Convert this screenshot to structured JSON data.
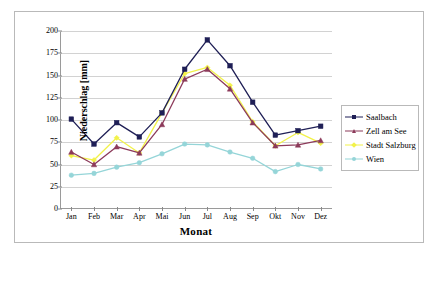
{
  "chart_data": {
    "type": "line",
    "title": "",
    "xlabel": "Monat",
    "ylabel": "Niederschlag [mm]",
    "categories": [
      "Jan",
      "Feb",
      "Mar",
      "Apr",
      "Mai",
      "Jun",
      "Jul",
      "Aug",
      "Sep",
      "Okt",
      "Nov",
      "Dez"
    ],
    "ylim": [
      0,
      200
    ],
    "yticks": [
      0,
      25,
      50,
      75,
      100,
      125,
      150,
      175,
      200
    ],
    "grid": true,
    "legend_position": "right",
    "series": [
      {
        "name": "Saalbach",
        "color": "#1f1f56",
        "marker": "square",
        "values": [
          101,
          73,
          97,
          81,
          108,
          157,
          190,
          161,
          120,
          83,
          88,
          93
        ]
      },
      {
        "name": "Zell am See",
        "color": "#8c3a5a",
        "marker": "triangle",
        "values": [
          64,
          50,
          70,
          63,
          95,
          146,
          157,
          135,
          97,
          71,
          72,
          77
        ]
      },
      {
        "name": "Stadt Salzburg",
        "color": "#f2f24a",
        "marker": "diamond",
        "values": [
          60,
          55,
          80,
          63,
          108,
          152,
          159,
          139,
          98,
          71,
          86,
          74
        ]
      },
      {
        "name": "Wien",
        "color": "#95d5d8",
        "marker": "circle",
        "values": [
          38,
          40,
          47,
          52,
          62,
          73,
          72,
          64,
          57,
          42,
          50,
          45
        ]
      }
    ]
  },
  "legend": {
    "entries": [
      {
        "label": "Saalbach"
      },
      {
        "label": "Zell am See"
      },
      {
        "label": "Stadt Salzburg"
      },
      {
        "label": "Wien"
      }
    ]
  }
}
